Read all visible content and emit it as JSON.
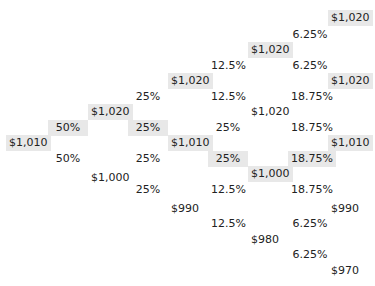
{
  "tree": {
    "highlight_color": "#e8e8e8",
    "columns": [
      {
        "kind": "price",
        "x": 6,
        "nodes": [
          {
            "label": "$1,010",
            "y": 143,
            "highlighted": true
          }
        ]
      },
      {
        "kind": "prob",
        "x": 48,
        "w": 40,
        "nodes": [
          {
            "label": "50%",
            "y": 128,
            "highlighted": true
          },
          {
            "label": "50%",
            "y": 159,
            "highlighted": false
          }
        ]
      },
      {
        "kind": "price",
        "x": 88,
        "nodes": [
          {
            "label": "$1,020",
            "y": 112,
            "highlighted": true
          },
          {
            "label": "$1,000",
            "y": 178,
            "highlighted": false
          }
        ]
      },
      {
        "kind": "prob",
        "x": 128,
        "w": 40,
        "nodes": [
          {
            "label": "25%",
            "y": 97,
            "highlighted": false
          },
          {
            "label": "25%",
            "y": 128,
            "highlighted": true
          },
          {
            "label": "25%",
            "y": 159,
            "highlighted": false
          },
          {
            "label": "25%",
            "y": 190,
            "highlighted": false
          }
        ]
      },
      {
        "kind": "price",
        "x": 168,
        "nodes": [
          {
            "label": "$1,020",
            "y": 81,
            "highlighted": true
          },
          {
            "label": "$1,010",
            "y": 143,
            "highlighted": true
          },
          {
            "label": "$990",
            "y": 209,
            "highlighted": false
          }
        ]
      },
      {
        "kind": "prob",
        "x": 208,
        "w": 40,
        "nodes": [
          {
            "label": "12.5%",
            "y": 66,
            "highlighted": false
          },
          {
            "label": "12.5%",
            "y": 97,
            "highlighted": false
          },
          {
            "label": "25%",
            "y": 128,
            "highlighted": false
          },
          {
            "label": "25%",
            "y": 159,
            "highlighted": true
          },
          {
            "label": "12.5%",
            "y": 190,
            "highlighted": false
          },
          {
            "label": "12.5%",
            "y": 224,
            "highlighted": false
          }
        ]
      },
      {
        "kind": "price",
        "x": 248,
        "nodes": [
          {
            "label": "$1,020",
            "y": 50,
            "highlighted": true
          },
          {
            "label": "$1,020",
            "y": 112,
            "highlighted": false
          },
          {
            "label": "$1,000",
            "y": 174,
            "highlighted": true
          },
          {
            "label": "$980",
            "y": 240,
            "highlighted": false
          }
        ]
      },
      {
        "kind": "prob",
        "x": 288,
        "w": 44,
        "nodes": [
          {
            "label": "6.25%",
            "y": 35,
            "highlighted": false
          },
          {
            "label": "6.25%",
            "y": 66,
            "highlighted": false
          },
          {
            "label": "18.75%",
            "y": 97,
            "highlighted": false
          },
          {
            "label": "18.75%",
            "y": 128,
            "highlighted": false
          },
          {
            "label": "18.75%",
            "y": 159,
            "highlighted": true
          },
          {
            "label": "18.75%",
            "y": 190,
            "highlighted": false
          },
          {
            "label": "6.25%",
            "y": 224,
            "highlighted": false
          },
          {
            "label": "6.25%",
            "y": 255,
            "highlighted": false
          }
        ]
      },
      {
        "kind": "price",
        "x": 328,
        "nodes": [
          {
            "label": "$1,020",
            "y": 18,
            "highlighted": true
          },
          {
            "label": "$1,020",
            "y": 81,
            "highlighted": true
          },
          {
            "label": "$1,010",
            "y": 143,
            "highlighted": true
          },
          {
            "label": "$990",
            "y": 209,
            "highlighted": false
          },
          {
            "label": "$970",
            "y": 271,
            "highlighted": false
          }
        ]
      }
    ]
  }
}
